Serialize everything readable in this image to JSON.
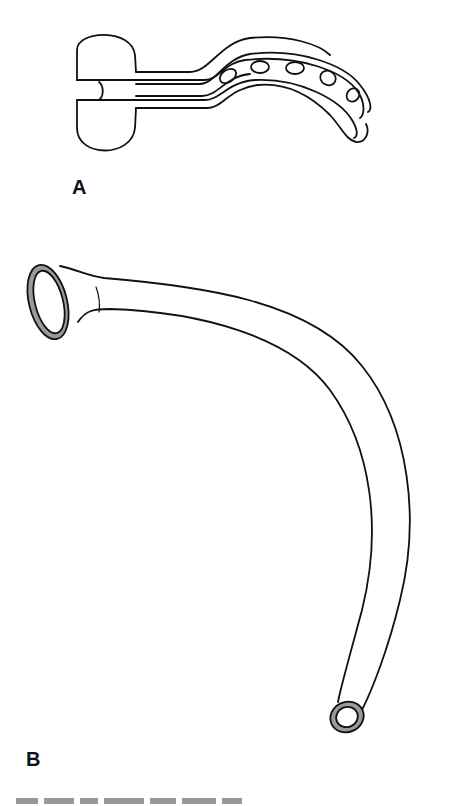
{
  "figure": {
    "panels": [
      {
        "id": "A",
        "label": "A",
        "subject": "oropharyngeal airway"
      },
      {
        "id": "B",
        "label": "B",
        "subject": "nasopharyngeal airway"
      }
    ],
    "caption_visible": "partially cropped, unreadable",
    "colors": {
      "line": "#111111",
      "rim_fill": "#9a9a9a",
      "background": "#ffffff"
    }
  }
}
